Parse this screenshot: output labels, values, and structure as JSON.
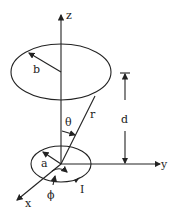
{
  "diagram": {
    "labels": {
      "z": "z",
      "b": "b",
      "theta": "θ",
      "r": "r",
      "d": "d",
      "a": "a",
      "y": "y",
      "x": "x",
      "phi": "ϕ",
      "I": "I"
    },
    "elements": {
      "upper_loop": "circular loop of radius b at height d",
      "lower_loop": "circular loop of radius a carrying current I",
      "axes": [
        "x",
        "y",
        "z"
      ]
    },
    "colors": {
      "stroke": "#222222",
      "background": "#ffffff"
    }
  }
}
